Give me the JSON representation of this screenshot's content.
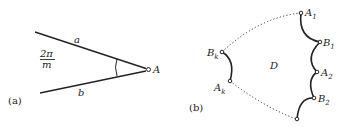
{
  "figure": {
    "panel_a": {
      "caption": "(a)",
      "line_upper_label": "a",
      "line_lower_label": "b",
      "angle_numerator": "2π",
      "angle_denominator": "m",
      "vertex_label": "A"
    },
    "panel_b": {
      "caption": "(b)",
      "region_label": "D",
      "points": [
        {
          "base": "B",
          "sub": "k"
        },
        {
          "base": "A",
          "sub": "k"
        },
        {
          "base": "A",
          "sub": "1"
        },
        {
          "base": "B",
          "sub": "1"
        },
        {
          "base": "A",
          "sub": "2"
        },
        {
          "base": "B",
          "sub": "2"
        }
      ]
    },
    "colors": {
      "ink": "#222222",
      "background": "#ffffff"
    }
  }
}
